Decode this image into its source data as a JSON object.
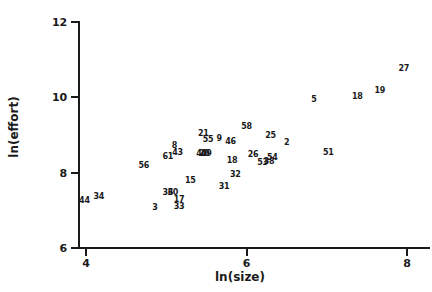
{
  "chart_data": {
    "type": "scatter",
    "title": "",
    "xlabel": "ln(size)",
    "ylabel": "ln(effort)",
    "xlim": [
      3.6,
      8.4
    ],
    "ylim": [
      6,
      12
    ],
    "xticks": [
      4,
      6,
      8
    ],
    "yticks": [
      6,
      8,
      10,
      12
    ],
    "xtick_labels": [
      "4",
      "6",
      "8"
    ],
    "ytick_labels": [
      "6",
      "8",
      "10",
      "12"
    ],
    "grid": false,
    "legend": false,
    "marker_style": "text-label",
    "note": "Each data point is rendered as its case-number label",
    "points": [
      {
        "label": "44",
        "x": 3.98,
        "y": 7.25
      },
      {
        "label": "34",
        "x": 4.16,
        "y": 7.36
      },
      {
        "label": "3",
        "x": 4.86,
        "y": 7.06
      },
      {
        "label": "33",
        "x": 5.16,
        "y": 7.08
      },
      {
        "label": "17",
        "x": 5.16,
        "y": 7.28
      },
      {
        "label": "36",
        "x": 5.02,
        "y": 7.47
      },
      {
        "label": "30",
        "x": 5.08,
        "y": 7.47
      },
      {
        "label": "15",
        "x": 5.3,
        "y": 7.77
      },
      {
        "label": "31",
        "x": 5.72,
        "y": 7.62
      },
      {
        "label": "56",
        "x": 4.72,
        "y": 8.17
      },
      {
        "label": "61",
        "x": 5.02,
        "y": 8.42
      },
      {
        "label": "32",
        "x": 5.86,
        "y": 7.93
      },
      {
        "label": "43",
        "x": 5.14,
        "y": 8.52
      },
      {
        "label": "8",
        "x": 5.1,
        "y": 8.72
      },
      {
        "label": "40",
        "x": 5.44,
        "y": 8.49
      },
      {
        "label": "49",
        "x": 5.5,
        "y": 8.49
      },
      {
        "label": "20",
        "x": 5.47,
        "y": 8.49
      },
      {
        "label": "18",
        "x": 5.82,
        "y": 8.32
      },
      {
        "label": "53",
        "x": 6.2,
        "y": 8.26
      },
      {
        "label": "38",
        "x": 6.28,
        "y": 8.28
      },
      {
        "label": "54",
        "x": 6.32,
        "y": 8.4
      },
      {
        "label": "26",
        "x": 6.08,
        "y": 8.46
      },
      {
        "label": "21",
        "x": 5.46,
        "y": 9.02
      },
      {
        "label": "55",
        "x": 5.52,
        "y": 8.88
      },
      {
        "label": "9",
        "x": 5.66,
        "y": 8.9
      },
      {
        "label": "46",
        "x": 5.8,
        "y": 8.82
      },
      {
        "label": "58",
        "x": 6.0,
        "y": 9.21
      },
      {
        "label": "25",
        "x": 6.3,
        "y": 8.98
      },
      {
        "label": "2",
        "x": 6.5,
        "y": 8.78
      },
      {
        "label": "51",
        "x": 7.02,
        "y": 8.52
      },
      {
        "label": "5",
        "x": 6.84,
        "y": 9.92
      },
      {
        "label": "18b",
        "display": "18",
        "x": 7.38,
        "y": 10.0
      },
      {
        "label": "19",
        "x": 7.66,
        "y": 10.18
      },
      {
        "label": "27",
        "x": 7.96,
        "y": 10.74
      }
    ]
  }
}
